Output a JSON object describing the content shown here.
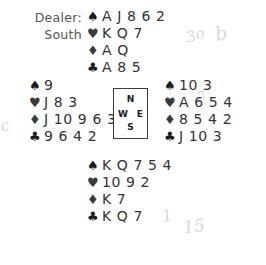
{
  "dealer": {
    "label": "Dealer:",
    "value": "South"
  },
  "compass": {
    "north": "N",
    "west": "W",
    "east": "E",
    "south": "S"
  },
  "suit_symbols": {
    "spade": "♠",
    "heart": "♥",
    "diamond": "♦",
    "club": "♣"
  },
  "hands": {
    "north": {
      "spades": "A J 8 6 2",
      "hearts": "K Q 7",
      "diamonds": "A Q",
      "clubs": "A 8 5"
    },
    "west": {
      "spades": "9",
      "hearts": "J 8 3",
      "diamonds": "J 10 9 6 3",
      "clubs": "9 6 4 2"
    },
    "east": {
      "spades": "10 3",
      "hearts": "A 6 5 4",
      "diamonds": "8 5 4 2",
      "clubs": "J 10 3"
    },
    "south": {
      "spades": "K Q 7 5 4",
      "hearts": "10 9 2",
      "diamonds": "K 7",
      "clubs": "K Q 7"
    }
  },
  "annotations": {
    "mark_1": "3o",
    "mark_2": "b",
    "mark_3": "1",
    "mark_4": "15",
    "mark_5": "c",
    "mark_6": "7"
  },
  "colors": {
    "background": "#ffffff",
    "text": "#333333",
    "symbol": "#1c1c1c",
    "border": "#3b3b3b",
    "pencil": "#d9d9d9"
  }
}
